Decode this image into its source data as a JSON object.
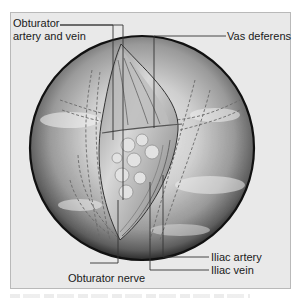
{
  "figure": {
    "type": "surgical-illustration",
    "view": "laparoscopic view of pelvic lymph node region",
    "labels": {
      "top_left": "Obturator artery and vein",
      "top_left_line1": "Obturator",
      "top_left_line2": "artery and vein",
      "top_right": "Vas deferens",
      "bottom_left": "Obturator nerve",
      "bottom_right_1": "Iliac artery",
      "bottom_right_2": "Iliac vein"
    },
    "colors": {
      "frame_bg": "#e9e9e9",
      "frame_border": "#b9b9b9",
      "circle_edge": "#111111",
      "leader_line": "#333333",
      "text": "#1a1a1a"
    }
  }
}
